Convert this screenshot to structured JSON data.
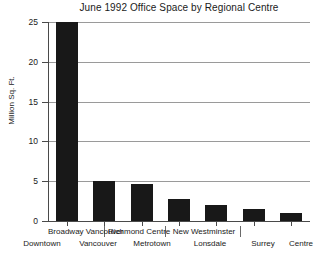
{
  "chart_data": {
    "type": "bar",
    "title": "June 1992 Office Space by Regional Centre",
    "xlabel": "",
    "ylabel": "Million Sq. Ft.",
    "ylim": [
      0,
      25
    ],
    "yticks": [
      0,
      5,
      10,
      15,
      20,
      25
    ],
    "grid": true,
    "legend": false,
    "categories": [
      "Downtown Vancouver",
      "Broadway Vancouver",
      "Metrotown",
      "Richmond Centre",
      "Lonsdale",
      "New Westminster",
      "Surrey Centre"
    ],
    "values": [
      25.0,
      5.0,
      4.7,
      2.8,
      2.0,
      1.5,
      1.0
    ],
    "bar_color": "#181818"
  },
  "axis": {
    "y_tick_labels": [
      "0",
      "5",
      "10",
      "15",
      "20",
      "25"
    ],
    "y_title": "Million Sq. Ft."
  },
  "x_axis_labels": {
    "top_row": [
      "Broadway Vancouver",
      "Richmond  Centre",
      "New Westminster"
    ],
    "bottom_row": [
      "Downtown",
      "Vancouver",
      "Metrotown",
      "Lonsdale",
      "Surrey",
      "Centre"
    ]
  }
}
